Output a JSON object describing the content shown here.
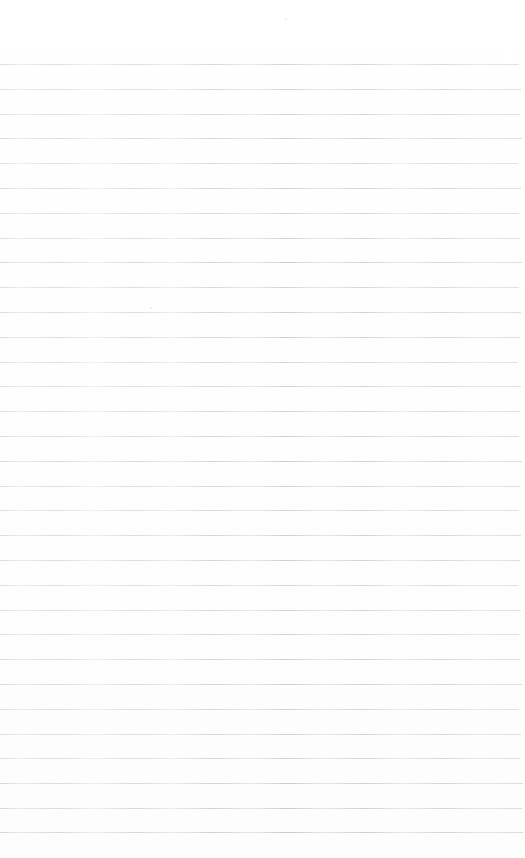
{
  "document": {
    "kind": "lined-notebook-page",
    "title": "Lined Notebook Page",
    "visible_text": "",
    "has_handwriting": false,
    "has_printed_text": false,
    "has_margin_rule": false,
    "page_number_shown": "",
    "header_text": "",
    "footer_text": ""
  },
  "canvas": {
    "width": 525,
    "height": 858
  },
  "colors": {
    "paper_background": "#fefefe",
    "rule_line": "#c8c8d0",
    "rule_line_dark": "#b0b0b8",
    "speck": "#aaaab4"
  },
  "ruling": {
    "line_count": 32,
    "first_line_y": 64,
    "last_line_y": 832,
    "spacing_px": 24.8,
    "line_thickness_px": 1,
    "line_left_x": 0,
    "line_right_x": 519,
    "top_margin_px": 64,
    "bottom_margin_px": 26,
    "line_positions_y": [
      64,
      88.8,
      113.6,
      138.4,
      163.2,
      188,
      212.8,
      237.6,
      262.4,
      287.2,
      312,
      336.8,
      361.6,
      386.4,
      411.2,
      436,
      460.8,
      485.6,
      510.4,
      535.2,
      560,
      584.8,
      609.6,
      634.4,
      659.2,
      684,
      708.8,
      733.6,
      758.4,
      783.2,
      808,
      832
    ],
    "line_widths_px": [
      519,
      521,
      520,
      522,
      518,
      521,
      519,
      520,
      522,
      519,
      521,
      520,
      518,
      521,
      520,
      519,
      522,
      520,
      519,
      521,
      520,
      518,
      521,
      519,
      520,
      522,
      519,
      521,
      520,
      523,
      522,
      523
    ],
    "line_opacities": [
      0.78,
      0.8,
      0.82,
      0.86,
      0.74,
      0.84,
      0.8,
      0.82,
      0.88,
      0.78,
      0.84,
      0.86,
      0.76,
      0.82,
      0.8,
      0.84,
      0.88,
      0.82,
      0.78,
      0.86,
      0.84,
      0.76,
      0.82,
      0.8,
      0.86,
      0.88,
      0.8,
      0.84,
      0.82,
      0.9,
      0.92,
      0.94
    ]
  },
  "specks": [
    {
      "x": 285,
      "y": 18,
      "size": 2
    },
    {
      "x": 150,
      "y": 307,
      "size": 2
    },
    {
      "x": 470,
      "y": 166,
      "size": 1
    }
  ]
}
